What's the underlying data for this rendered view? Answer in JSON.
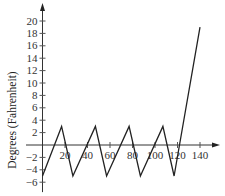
{
  "chart_data": {
    "type": "line",
    "title": "",
    "xlabel": "",
    "ylabel": "Degrees (Fahrenheit)",
    "xlim": [
      0,
      150
    ],
    "ylim": [
      -7,
      21
    ],
    "x_ticks": [
      20,
      40,
      60,
      80,
      100,
      120,
      140
    ],
    "y_ticks": [
      -6,
      -4,
      -2,
      2,
      4,
      6,
      8,
      10,
      12,
      14,
      16,
      18,
      20
    ],
    "grid": false,
    "legend": null,
    "series": [
      {
        "name": "temperature",
        "color": "#222222",
        "x": [
          0,
          17,
          27,
          47,
          57,
          77,
          87,
          107,
          117,
          140
        ],
        "y": [
          -5,
          3,
          -5,
          3,
          -5,
          3,
          -5,
          3,
          -5,
          19
        ]
      }
    ]
  }
}
